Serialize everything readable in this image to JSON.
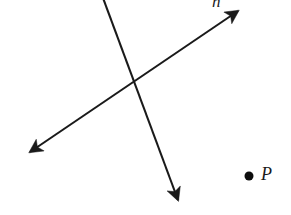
{
  "figure": {
    "background_color": "#ffffff",
    "stroke_color": "#1a1a1a",
    "width": 291,
    "height": 215,
    "labels": {
      "line_label": "n",
      "point_label": "P"
    },
    "point": {
      "name": "P",
      "x": 249,
      "y": 176,
      "radius": 4.5,
      "fill": "#0d0d0d"
    },
    "lines": [
      {
        "name": "line-n",
        "label": "n",
        "description": "double-headed arrow rising to the upper right",
        "x1": 30,
        "y1": 152,
        "x2": 238,
        "y2": 11,
        "arrow_start": true,
        "arrow_end": true,
        "stroke_width": 2.1
      },
      {
        "name": "line-steep",
        "label": "",
        "description": "steep line descending to the lower right, clipped at top edge",
        "x1": 103,
        "y1": -2,
        "x2": 178,
        "y2": 200,
        "arrow_start": false,
        "arrow_end": true,
        "stroke_width": 2.1
      }
    ],
    "intersection": {
      "x": 134,
      "y": 82
    }
  }
}
